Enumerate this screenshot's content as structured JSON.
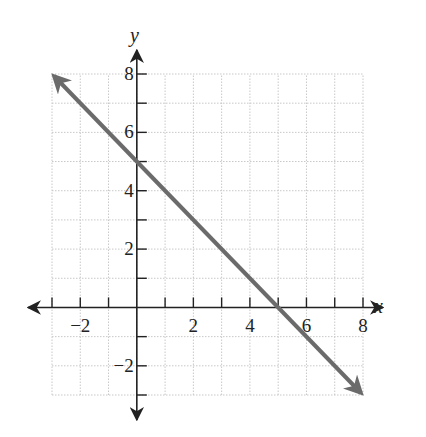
{
  "chart_data": {
    "type": "line",
    "title": "",
    "xlabel": "x",
    "ylabel": "y",
    "xlim": [
      -3,
      8
    ],
    "ylim": [
      -3,
      8
    ],
    "grid": true,
    "x_ticks": [
      -3,
      -2,
      -1,
      1,
      2,
      3,
      4,
      5,
      6,
      7,
      8
    ],
    "y_ticks": [
      -3,
      -2,
      -1,
      1,
      2,
      3,
      4,
      5,
      6,
      7,
      8
    ],
    "x_tick_labels": [
      "-2",
      "2",
      "4",
      "6",
      "8"
    ],
    "y_tick_labels": [
      "-2",
      "2",
      "4",
      "6",
      "8"
    ],
    "series": [
      {
        "name": "y = -x + 5",
        "equation": "y = -x + 5",
        "x": [
          -3,
          8
        ],
        "y": [
          8,
          -3
        ],
        "y_intercept": 5,
        "x_intercept": 5,
        "slope": -1,
        "arrows": "both",
        "color": "#666666"
      }
    ]
  },
  "labels": {
    "x_axis": "x",
    "y_axis": "y",
    "x_ticks": [
      {
        "value": -2,
        "text": "−2"
      },
      {
        "value": 2,
        "text": "2"
      },
      {
        "value": 4,
        "text": "4"
      },
      {
        "value": 6,
        "text": "6"
      },
      {
        "value": 8,
        "text": "8"
      }
    ],
    "y_ticks": [
      {
        "value": -2,
        "text": "−2"
      },
      {
        "value": 2,
        "text": "2"
      },
      {
        "value": 4,
        "text": "4"
      },
      {
        "value": 6,
        "text": "6"
      },
      {
        "value": 8,
        "text": "8"
      }
    ]
  },
  "colors": {
    "axis": "#222222",
    "grid": "#c8c8c8",
    "line": "#6b6b6b"
  }
}
